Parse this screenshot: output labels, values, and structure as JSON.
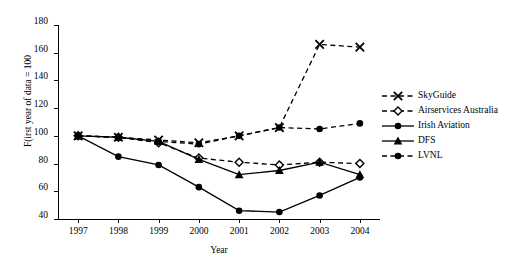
{
  "chart_data": {
    "type": "line",
    "title": "",
    "xlabel": "Year",
    "ylabel": "F(irst year of data = 100",
    "x": [
      1997,
      1998,
      1999,
      2000,
      2001,
      2002,
      2003,
      2004
    ],
    "xlim": [
      1996.5,
      2004.5
    ],
    "ylim": [
      40,
      180
    ],
    "yticks": [
      40,
      60,
      80,
      100,
      120,
      140,
      160,
      180
    ],
    "xticks": [
      "1997",
      "1998",
      "1999",
      "2000",
      "2001",
      "2002",
      "2003",
      "2004"
    ],
    "grid": false,
    "legend_position": "right",
    "series": [
      {
        "name": "SkyGuide",
        "marker": "cross-x",
        "line": "dashed",
        "color": "#000000",
        "x": [
          1997,
          1998,
          1999,
          2000,
          2001,
          2002,
          2003,
          2004
        ],
        "values": [
          100,
          99,
          97,
          95,
          100,
          106,
          166,
          164
        ]
      },
      {
        "name": "Airservices Australia",
        "marker": "diamond-open",
        "line": "dashed",
        "color": "#000000",
        "x": [
          1997,
          1998,
          1999,
          2000,
          2001,
          2002,
          2003,
          2004
        ],
        "values": [
          100,
          99,
          95,
          84,
          81,
          79,
          81,
          80
        ]
      },
      {
        "name": "Irish Aviation",
        "marker": "circle-filled",
        "line": "solid",
        "color": "#000000",
        "x": [
          1997,
          1998,
          1999,
          2000,
          2001,
          2002,
          2003,
          2004
        ],
        "values": [
          100,
          85,
          79,
          63,
          46,
          45,
          57,
          70
        ]
      },
      {
        "name": "DFS",
        "marker": "triangle-filled",
        "line": "solid",
        "color": "#000000",
        "x": [
          1997,
          1998,
          1999,
          2000,
          2001,
          2002,
          2003,
          2004
        ],
        "values": [
          100,
          99,
          96,
          83,
          72,
          75,
          81,
          72
        ]
      },
      {
        "name": "LVNL",
        "marker": "circle-filled",
        "line": "dashed",
        "color": "#000000",
        "x": [
          1997,
          1998,
          1999,
          2000,
          2001,
          2002,
          2003,
          2004
        ],
        "values": [
          100,
          99,
          96,
          94,
          100,
          106,
          105,
          109
        ]
      }
    ]
  },
  "legend": {
    "items": [
      {
        "label": "SkyGuide"
      },
      {
        "label": "Airservices Australia"
      },
      {
        "label": "Irish Aviation"
      },
      {
        "label": "DFS"
      },
      {
        "label": "LVNL"
      }
    ]
  }
}
